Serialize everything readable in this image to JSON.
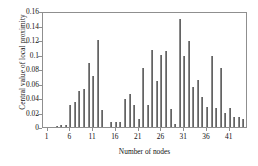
{
  "chart_data": {
    "type": "bar",
    "title": "",
    "xlabel": "Number of nodes",
    "ylabel": "Central value of local proximity",
    "xlim": [
      0,
      45
    ],
    "ylim": [
      0,
      0.16
    ],
    "ytick_labels": [
      "0.16",
      "0.14",
      "0.12",
      "0.1",
      "0.08",
      "0.06",
      "0.04",
      "0.02",
      "0"
    ],
    "ytick_values": [
      0.16,
      0.14,
      0.12,
      0.1,
      0.08,
      0.06,
      0.04,
      0.02,
      0
    ],
    "xtick_labels": [
      "1",
      "6",
      "11",
      "16",
      "21",
      "26",
      "31",
      "36",
      "41"
    ],
    "xtick_values": [
      1,
      6,
      11,
      16,
      21,
      26,
      31,
      36,
      41
    ],
    "grid": false,
    "legend": null,
    "bar_color": "#636363",
    "axis_color": "#8f8f8f",
    "categories": [
      1,
      2,
      3,
      4,
      5,
      6,
      7,
      8,
      9,
      10,
      11,
      12,
      13,
      14,
      15,
      16,
      17,
      18,
      19,
      20,
      21,
      22,
      23,
      24,
      25,
      26,
      27,
      28,
      29,
      30,
      31,
      32,
      33,
      34,
      35,
      36,
      37,
      38,
      39,
      40,
      41,
      42,
      43,
      44
    ],
    "values": [
      0.0005,
      0.0005,
      0.0015,
      0.0025,
      0.0025,
      0.031,
      0.0345,
      0.05,
      0.053,
      0.0885,
      0.071,
      0.12,
      0.0235,
      0.0005,
      0.0075,
      0.0075,
      0.0075,
      0.039,
      0.0455,
      0.03,
      0.0105,
      0.082,
      0.0305,
      0.1065,
      0.0635,
      0.1,
      0.1045,
      0.0245,
      0.0035,
      0.149,
      0.0975,
      0.119,
      0.055,
      0.065,
      0.042,
      0.028,
      0.0975,
      0.0265,
      0.082,
      0.019,
      0.026,
      0.0135,
      0.0135,
      0.0115
    ]
  }
}
